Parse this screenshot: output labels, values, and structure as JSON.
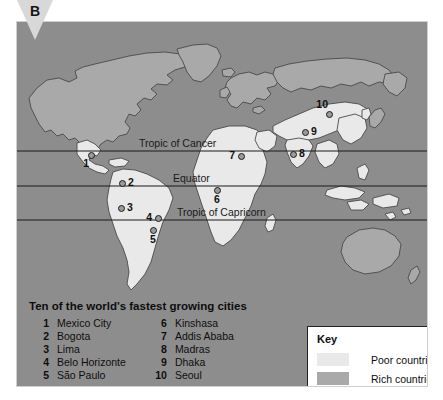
{
  "figure": {
    "panel_label": "B"
  },
  "map": {
    "latitude_lines": [
      {
        "name": "Tropic of Cancer",
        "label": "Tropic of Cancer",
        "y": 129
      },
      {
        "name": "Equator",
        "label": "Equator",
        "y": 164
      },
      {
        "name": "Tropic of Capricorn",
        "label": "Tropic of Capricorn",
        "y": 198
      }
    ],
    "ocean_color": "#8d8d8d",
    "poor_color": "#e9e9e9",
    "rich_color": "#a9a9a9",
    "coast_color": "#4a4a4a"
  },
  "markers": [
    {
      "id": 1,
      "label": "1",
      "city": "Mexico City",
      "x": 74,
      "y": 133,
      "pos": "bleft"
    },
    {
      "id": 2,
      "label": "2",
      "city": "Bogota",
      "x": 105,
      "y": 161,
      "pos": "right"
    },
    {
      "id": 3,
      "label": "3",
      "city": "Lima",
      "x": 104,
      "y": 186,
      "pos": "right"
    },
    {
      "id": 4,
      "label": "4",
      "city": "Belo Horizonte",
      "x": 141,
      "y": 196,
      "pos": "left"
    },
    {
      "id": 5,
      "label": "5",
      "city": "São Paulo",
      "x": 136,
      "y": 208,
      "pos": "below"
    },
    {
      "id": 6,
      "label": "6",
      "city": "Kinshasa",
      "x": 200,
      "y": 168,
      "pos": "below"
    },
    {
      "id": 7,
      "label": "7",
      "city": "Addis Ababa",
      "x": 224,
      "y": 134,
      "pos": "left"
    },
    {
      "id": 8,
      "label": "8",
      "city": "Madras",
      "x": 276,
      "y": 132,
      "pos": "right"
    },
    {
      "id": 9,
      "label": "9",
      "city": "Dhaka",
      "x": 288,
      "y": 110,
      "pos": "right"
    },
    {
      "id": 10,
      "label": "10",
      "city": "Seoul",
      "x": 312,
      "y": 92,
      "pos": "aleft"
    }
  ],
  "caption": {
    "title": "Ten of the world's fastest growing cities",
    "column1": [
      {
        "num": "1",
        "name": "Mexico City"
      },
      {
        "num": "2",
        "name": "Bogota"
      },
      {
        "num": "3",
        "name": "Lima"
      },
      {
        "num": "4",
        "name": "Belo Horizonte"
      },
      {
        "num": "5",
        "name": "São Paulo"
      }
    ],
    "column2": [
      {
        "num": "6",
        "name": "Kinshasa"
      },
      {
        "num": "7",
        "name": "Addis Ababa"
      },
      {
        "num": "8",
        "name": "Madras"
      },
      {
        "num": "9",
        "name": "Dhaka"
      },
      {
        "num": "10",
        "name": "Seoul"
      }
    ]
  },
  "key": {
    "title": "Key",
    "entries": [
      {
        "label": "Poor countries",
        "color": "#e9e9e9"
      },
      {
        "label": "Rich countries",
        "color": "#a9a9a9"
      }
    ]
  }
}
